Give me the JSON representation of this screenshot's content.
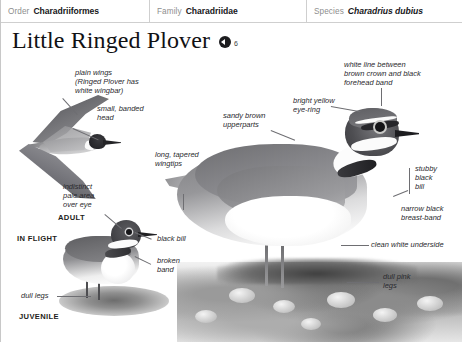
{
  "taxonomy": [
    {
      "key": "Order",
      "value": "Charadriiformes",
      "italic": false
    },
    {
      "key": "Family",
      "value": "Charadriidae",
      "italic": false
    },
    {
      "key": "Species",
      "value": "Charadrius dubius",
      "italic": true
    }
  ],
  "title": {
    "common_name": "Little Ringed Plover",
    "audio_icon": "speaker-icon",
    "audio_track_number": "6"
  },
  "callouts": [
    {
      "id": "plain-wings",
      "text": "plain wings\n(Ringed Plover has\nwhite wingbar)"
    },
    {
      "id": "small-banded-head",
      "text": "small, banded\nhead"
    },
    {
      "id": "indistinct-pale-area",
      "text": "indistinct\npale area\nover eye"
    },
    {
      "id": "long-tapered-wingtips",
      "text": "long, tapered\nwingtips"
    },
    {
      "id": "sandy-brown-upperparts",
      "text": "sandy brown\nupperparts"
    },
    {
      "id": "white-line",
      "text": "white line between\nbrown crown and black\nforehead band"
    },
    {
      "id": "bright-yellow-eye-ring",
      "text": "bright yellow\neye-ring"
    },
    {
      "id": "stubby-black-bill",
      "text": "stubby\nblack\nbill"
    },
    {
      "id": "narrow-black-breast-band",
      "text": "narrow black\nbreast-band"
    },
    {
      "id": "clean-white-underside",
      "text": "clean white underside"
    },
    {
      "id": "dull-pink-legs",
      "text": "dull pink\nlegs"
    },
    {
      "id": "black-bill",
      "text": "black bill"
    },
    {
      "id": "broken-band",
      "text": "broken\nband"
    },
    {
      "id": "dull-legs",
      "text": "dull legs"
    }
  ],
  "stage_labels": [
    {
      "id": "adult",
      "text": "ADULT"
    },
    {
      "id": "in-flight",
      "text": "IN FLIGHT"
    },
    {
      "id": "juvenile",
      "text": "JUVENILE"
    }
  ],
  "colors": {
    "page_background": "#ffffff",
    "rule": "#cfcfcf",
    "key_text": "#8e8e8e",
    "value_text": "#17171a",
    "callout_text": "#2a2a2e",
    "leader_line": "#6e6e72"
  }
}
